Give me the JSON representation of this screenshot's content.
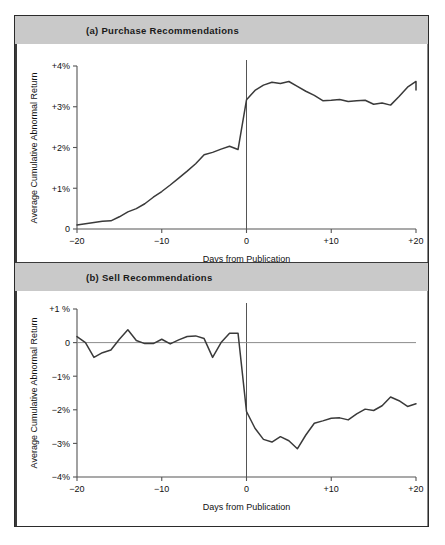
{
  "figure": {
    "panels": [
      {
        "id": "purchase",
        "title": "(a) Purchase Recommendations",
        "xlabel": "Days from Publication",
        "ylabel": "Average Cumulative Abnormal Return",
        "yticks": [
          "+4%",
          "+3%",
          "+2%",
          "+1%",
          "0"
        ],
        "xticks": [
          "−20",
          "−10",
          "0",
          "+10",
          "+20"
        ]
      },
      {
        "id": "sell",
        "title": "(b) Sell Recommendations",
        "xlabel": "Days from Publication",
        "ylabel": "Average Cumulative Abnormal Return",
        "yticks": [
          "+1 %",
          "0",
          "−1%",
          "−2%",
          "−3%",
          "−4%"
        ],
        "xticks": [
          "−20",
          "−10",
          "0",
          "+10",
          "+20"
        ]
      }
    ],
    "colors": {
      "band": "#c9c9c9",
      "line": "#3a3a3a",
      "axis": "#555555",
      "frame": "#2b2b2b",
      "zero_rule": "#8d8d8d"
    }
  },
  "chart_data": [
    {
      "type": "line",
      "title": "(a) Purchase Recommendations",
      "xlabel": "Days from Publication",
      "ylabel": "Average Cumulative Abnormal Return",
      "xlim": [
        -20,
        20
      ],
      "ylim": [
        0,
        4
      ],
      "ytick_values": [
        0,
        1,
        2,
        3,
        4
      ],
      "ytick_labels": [
        "0",
        "+1%",
        "+2%",
        "+3%",
        "+4%"
      ],
      "xtick_values": [
        -20,
        -10,
        0,
        10,
        20
      ],
      "xtick_labels": [
        "−20",
        "−10",
        "0",
        "+10",
        "+20"
      ],
      "grid": false,
      "legend": "none",
      "annotations": [
        {
          "type": "vline",
          "x": 0,
          "label": "publication day"
        }
      ],
      "x": [
        -20,
        -19,
        -18,
        -17,
        -16,
        -15,
        -14,
        -13,
        -12,
        -11,
        -10,
        -9,
        -8,
        -7,
        -6,
        -5,
        -4,
        -3,
        -2,
        -1,
        0,
        1,
        2,
        3,
        4,
        5,
        6,
        7,
        8,
        9,
        10,
        11,
        12,
        13,
        14,
        15,
        16,
        17,
        18,
        19,
        20
      ],
      "values": [
        0.1,
        0.13,
        0.16,
        0.19,
        0.2,
        0.3,
        0.42,
        0.5,
        0.62,
        0.78,
        0.92,
        1.08,
        1.25,
        1.42,
        1.6,
        1.82,
        1.88,
        1.96,
        2.03,
        1.95,
        3.17,
        3.4,
        3.53,
        3.6,
        3.57,
        3.62,
        3.5,
        3.38,
        3.28,
        3.15,
        3.16,
        3.18,
        3.13,
        3.15,
        3.16,
        3.06,
        3.09,
        3.04,
        3.25,
        3.48,
        3.62,
        3.41
      ]
    },
    {
      "type": "line",
      "title": "(b) Sell Recommendations",
      "xlabel": "Days from Publication",
      "ylabel": "Average Cumulative Abnormal Return",
      "xlim": [
        -20,
        20
      ],
      "ylim": [
        -4,
        1
      ],
      "ytick_values": [
        1,
        0,
        -1,
        -2,
        -3,
        -4
      ],
      "ytick_labels": [
        "+1 %",
        "0",
        "−1%",
        "−2%",
        "−3%",
        "−4%"
      ],
      "xtick_values": [
        -20,
        -10,
        0,
        10,
        20
      ],
      "xtick_labels": [
        "−20",
        "−10",
        "0",
        "+10",
        "+20"
      ],
      "grid": false,
      "legend": "none",
      "annotations": [
        {
          "type": "vline",
          "x": 0,
          "label": "publication day"
        },
        {
          "type": "hline",
          "y": 0,
          "label": "zero line"
        }
      ],
      "x": [
        -20,
        -19,
        -18,
        -17,
        -16,
        -15,
        -14,
        -13,
        -12,
        -11,
        -10,
        -9,
        -8,
        -7,
        -6,
        -5,
        -4,
        -3,
        -2,
        -1,
        0,
        1,
        2,
        3,
        4,
        5,
        6,
        7,
        8,
        9,
        10,
        11,
        12,
        13,
        14,
        15,
        16,
        17,
        18,
        19,
        20
      ],
      "values": [
        0.18,
        0.0,
        -0.44,
        -0.3,
        -0.22,
        0.1,
        0.38,
        0.06,
        -0.03,
        -0.03,
        0.1,
        -0.04,
        0.08,
        0.18,
        0.2,
        0.12,
        -0.44,
        0.0,
        0.28,
        0.28,
        -2.05,
        -2.55,
        -2.88,
        -2.96,
        -2.8,
        -2.92,
        -3.16,
        -2.75,
        -2.4,
        -2.33,
        -2.25,
        -2.24,
        -2.3,
        -2.12,
        -1.98,
        -2.02,
        -1.88,
        -1.62,
        -1.73,
        -1.9,
        -1.82
      ]
    }
  ]
}
